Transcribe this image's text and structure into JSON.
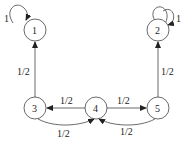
{
  "diagram": {
    "type": "markov-chain",
    "nodes": [
      {
        "id": "1",
        "label": "1",
        "x": 35,
        "y": 30
      },
      {
        "id": "2",
        "label": "2",
        "x": 158,
        "y": 30
      },
      {
        "id": "3",
        "label": "3",
        "x": 35,
        "y": 108
      },
      {
        "id": "4",
        "label": "4",
        "x": 96,
        "y": 108
      },
      {
        "id": "5",
        "label": "5",
        "x": 158,
        "y": 108
      }
    ],
    "edges": [
      {
        "from": "1",
        "to": "1",
        "label": "1"
      },
      {
        "from": "2",
        "to": "2",
        "label": "1"
      },
      {
        "from": "3",
        "to": "1",
        "label": "1/2"
      },
      {
        "from": "5",
        "to": "2",
        "label": "1/2"
      },
      {
        "from": "4",
        "to": "3",
        "label": "1/2"
      },
      {
        "from": "4",
        "to": "5",
        "label": "1/2"
      },
      {
        "from": "3",
        "to": "4",
        "label": "1/2"
      },
      {
        "from": "5",
        "to": "4",
        "label": "1/2"
      }
    ]
  }
}
